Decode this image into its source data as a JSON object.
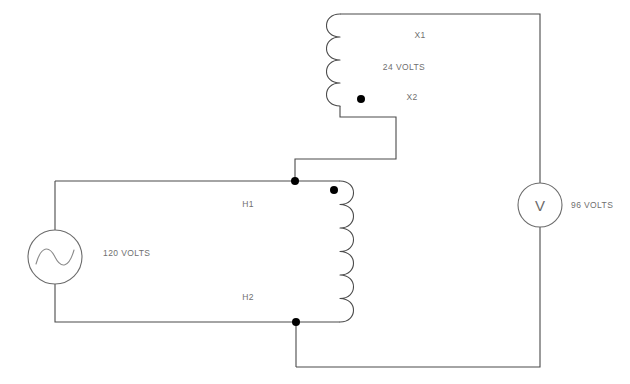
{
  "diagram": {
    "type": "electrical-schematic",
    "background_color": "#ffffff",
    "wire_color": "#4a4a4a",
    "label_color": "#6f6f6f",
    "node_color": "#000000",
    "source": {
      "symbol": "ac-voltage-source",
      "glyph": "sine-wave",
      "label": "120 VOLTS"
    },
    "meter": {
      "symbol": "voltmeter",
      "glyph": "V",
      "label": "96 VOLTS"
    },
    "transformer": {
      "secondary": {
        "terminal_top_label": "X1",
        "terminal_bottom_label": "X2",
        "winding_label": "24 VOLTS",
        "turns": 4,
        "polarity_dot": "x2-dot"
      },
      "primary": {
        "terminal_top_label": "H1",
        "terminal_bottom_label": "H2",
        "winding_label": "120 VOLTS",
        "turns": 6,
        "polarity_dot": "h1-dot"
      }
    },
    "junction_nodes": [
      {
        "name": "node-h1-junction"
      },
      {
        "name": "node-h2-junction"
      }
    ]
  }
}
